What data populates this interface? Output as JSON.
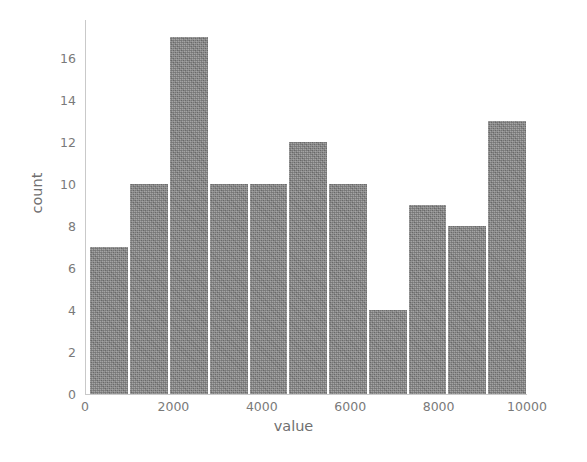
{
  "chart_data": {
    "type": "bar",
    "title": "",
    "subtitle": "",
    "xlabel": "value",
    "ylabel": "count",
    "xlim": [
      0,
      10000
    ],
    "ylim": [
      0,
      17.8
    ],
    "grid": false,
    "legend": null,
    "bar_color": "#888888",
    "bar_edge_color": "#ffffff",
    "text_color": "#7a7a7a",
    "background": "#ffffff",
    "xticks": [
      0,
      2000,
      4000,
      6000,
      8000,
      10000
    ],
    "xticklabels": [
      "0",
      "2000",
      "4000",
      "6000",
      "8000",
      "10000"
    ],
    "yticks": [
      0,
      2,
      4,
      6,
      8,
      10,
      12,
      14,
      16
    ],
    "yticklabels": [
      "0",
      "2",
      "4",
      "6",
      "8",
      "10",
      "12",
      "14",
      "16"
    ],
    "bin_edges": [
      100,
      1000,
      1900,
      2800,
      3700,
      4600,
      5500,
      6400,
      7300,
      8200,
      9100,
      10000
    ],
    "categories": [
      "100-1000",
      "1000-1900",
      "1900-2800",
      "2800-3700",
      "3700-4600",
      "4600-5500",
      "5500-6400",
      "6400-7300",
      "7300-8200",
      "8200-9100",
      "9100-10000"
    ],
    "values": [
      7,
      10,
      17,
      10,
      10,
      12,
      10,
      4,
      9,
      8,
      13
    ],
    "n_bins": 11,
    "total_count": 110
  }
}
